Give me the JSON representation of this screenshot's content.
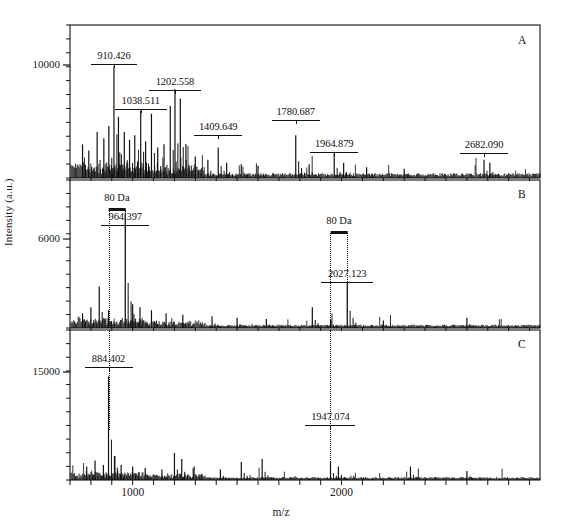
{
  "figure": {
    "xlabel": "m/z",
    "ylabel": "Intensity (a.u.)"
  },
  "panels": [
    {
      "id": "A",
      "letter": "A",
      "ytick_label": "10000",
      "annotations": [
        {
          "text": "910.426",
          "mz": 910.426
        },
        {
          "text": "1038.511",
          "mz": 1038.511
        },
        {
          "text": "1202.558",
          "mz": 1202.558
        },
        {
          "text": "1409.649",
          "mz": 1409.649
        },
        {
          "text": "1780.687",
          "mz": 1780.687
        },
        {
          "text": "1964.879",
          "mz": 1964.879
        },
        {
          "text": "2682.090",
          "mz": 2682.09
        }
      ],
      "delta_labels": []
    },
    {
      "id": "B",
      "letter": "B",
      "ytick_label": "6000",
      "annotations": [
        {
          "text": "964.397",
          "mz": 964.397
        },
        {
          "text": "2027.123",
          "mz": 2027.123
        }
      ],
      "delta_labels": [
        {
          "text": "80 Da",
          "from_mz": 884.4,
          "to_mz": 964.397
        },
        {
          "text": "80 Da",
          "from_mz": 1947.07,
          "to_mz": 2027.123
        }
      ]
    },
    {
      "id": "C",
      "letter": "C",
      "ytick_label": "15000",
      "annotations": [
        {
          "text": "884.402",
          "mz": 884.402
        },
        {
          "text": "1947.074",
          "mz": 1947.074
        }
      ],
      "delta_labels": []
    }
  ],
  "chart_data": {
    "type": "line",
    "title": "",
    "xlabel": "m/z",
    "ylabel": "Intensity (a.u.)",
    "xlim": [
      700,
      2950
    ],
    "xticks_labeled": [
      1000,
      2000
    ],
    "xtick_interval": 100,
    "grid": false,
    "legend": "none",
    "subplots": [
      {
        "panel": "A",
        "ylim": [
          0,
          13500
        ],
        "yticks_labeled": [
          10000
        ],
        "annotated_peaks": [
          {
            "mz": 910.426,
            "intensity": 9200
          },
          {
            "mz": 1038.511,
            "intensity": 5100
          },
          {
            "mz": 1202.558,
            "intensity": 6400
          },
          {
            "mz": 1409.649,
            "intensity": 2400
          },
          {
            "mz": 1780.687,
            "intensity": 3100
          },
          {
            "mz": 1964.879,
            "intensity": 1900
          },
          {
            "mz": 2682.09,
            "intensity": 1200
          }
        ]
      },
      {
        "panel": "B",
        "ylim": [
          0,
          9500
        ],
        "yticks_labeled": [
          6000
        ],
        "annotated_peaks": [
          {
            "mz": 964.397,
            "intensity": 6900
          },
          {
            "mz": 2027.123,
            "intensity": 2600
          }
        ]
      },
      {
        "panel": "C",
        "ylim": [
          0,
          24000
        ],
        "yticks_labeled": [
          15000
        ],
        "annotated_peaks": [
          {
            "mz": 884.402,
            "intensity": 15000
          },
          {
            "mz": 1947.074,
            "intensity": 2100
          }
        ]
      }
    ]
  }
}
